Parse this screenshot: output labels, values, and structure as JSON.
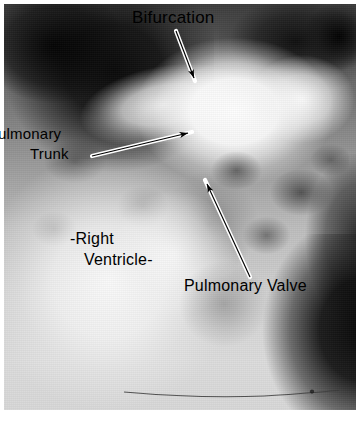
{
  "figure": {
    "kind": "annotated-radiograph",
    "modality": "angiocardiogram",
    "view": "frontal chest radiograph with radiographic contrast",
    "width": 363,
    "height": 421,
    "background_color": "#ffffff",
    "plate_color_dark": "#0a0a0a",
    "plate_color_light": "#ffffff",
    "annotation_color": "#000000",
    "annotation_outline_color": "#ffffff"
  },
  "annotations": [
    {
      "id": "bifurcation",
      "label": "Bifurcation",
      "label_lines": [
        "Bifurcation"
      ],
      "arrow": {
        "from_x": 176,
        "from_y": 31,
        "to_x": 196,
        "to_y": 83,
        "direction": "down-right",
        "style": "white-outlined-black-arrow"
      }
    },
    {
      "id": "pulmonary-trunk",
      "label": "Pulmonary Trunk",
      "label_lines": [
        "ulmonary",
        "Trunk"
      ],
      "note": "leading P is clipped by the left edge of the plate",
      "arrow": {
        "from_x": 92,
        "from_y": 156,
        "to_x": 193,
        "to_y": 132,
        "direction": "up-right",
        "style": "white-outlined-black-arrow"
      }
    },
    {
      "id": "right-ventricle",
      "label": "-Right Ventricle-",
      "label_lines": [
        "-Right",
        "Ventricle-"
      ],
      "arrow": null
    },
    {
      "id": "pulmonary-valve",
      "label": "Pulmonary Valve",
      "label_lines": [
        "Pulmonary Valve"
      ],
      "arrow": {
        "from_x": 250,
        "from_y": 277,
        "to_x": 205,
        "to_y": 181,
        "direction": "up-left",
        "style": "white-outlined-black-arrow"
      }
    }
  ],
  "structures": [
    "pulmonary trunk",
    "pulmonary artery bifurcation",
    "pulmonary valve",
    "right ventricle",
    "cardiac catheter"
  ]
}
